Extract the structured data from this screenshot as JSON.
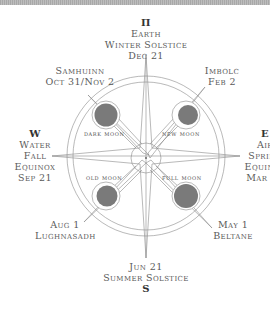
{
  "diagram": {
    "type": "wheel-of-the-year compass",
    "colors": {
      "line": "#8a8a8a",
      "moon_fill": "#7a7a7a",
      "text": "#5a5a5a",
      "topbar": "#b0b0b0"
    },
    "directions": {
      "north": {
        "symbol": "Π",
        "lines": [
          "Earth",
          "Winter Solstice",
          "Dec 21"
        ]
      },
      "south": {
        "symbol": "S",
        "lines": [
          "Jun 21",
          "Summer Solstice"
        ]
      },
      "west": {
        "symbol": "W",
        "lines": [
          "Water",
          "Fall",
          "Equinox",
          "Sep 21"
        ]
      },
      "east": {
        "symbol": "E",
        "lines": [
          "Air",
          "Spring",
          "Equinox",
          "Mar 21"
        ]
      }
    },
    "cross_quarters": {
      "northwest": {
        "lines": [
          "Samhuinn",
          "Oct 31/Nov 2"
        ]
      },
      "northeast": {
        "lines": [
          "Imbolc",
          "Feb 2"
        ]
      },
      "southwest": {
        "lines": [
          "Aug 1",
          "Lughnasadh"
        ]
      },
      "southeast": {
        "lines": [
          "May 1",
          "Beltane"
        ]
      }
    },
    "moons": {
      "dark": "dark moon",
      "new": "new moon",
      "old": "old moon",
      "full": "full moon"
    }
  }
}
